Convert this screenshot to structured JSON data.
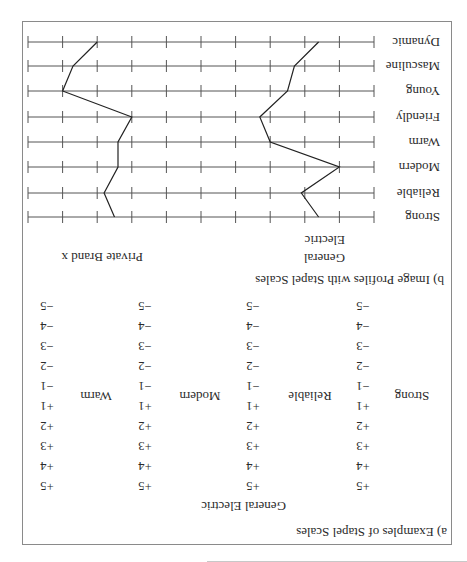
{
  "part_a": {
    "heading": "a)  Examples of Stapel Scales",
    "brand": "General Electric",
    "scale_values": [
      "+5",
      "+4",
      "+3",
      "+2",
      "+1",
      "−1",
      "−2",
      "−3",
      "−4",
      "−5"
    ],
    "items": [
      {
        "label": "Strong"
      },
      {
        "label": "Reliable"
      },
      {
        "label": "Modern"
      },
      {
        "label": "Warm"
      }
    ]
  },
  "part_b": {
    "heading": "b)  Image Profiles with Stapel Scales",
    "legend": [
      {
        "name_line1": "General",
        "name_line2": "Electric"
      },
      {
        "name_line1": "Private Brand x",
        "name_line2": ""
      }
    ]
  },
  "chart_data": {
    "type": "line",
    "title": "Image Profiles with Stapel Scales",
    "orientation": "horizontal profile (attributes as rows, scale on x)",
    "categories": [
      "Strong",
      "Reliable",
      "Modern",
      "Warm",
      "Friendly",
      "Young",
      "Masculine",
      "Dynamic"
    ],
    "xlim": [
      5,
      -5
    ],
    "x_ticks": [
      5,
      4,
      3,
      2,
      1,
      0,
      -1,
      -2,
      -3,
      -4,
      -5
    ],
    "tick_labels_shown": false,
    "grid": true,
    "legend_position": "above plot (text labels)",
    "series": [
      {
        "name": "General Electric",
        "values": [
          3.4,
          2.9,
          4.0,
          2.0,
          1.7,
          2.5,
          2.7,
          3.4
        ]
      },
      {
        "name": "Private Brand x",
        "values": [
          -2.5,
          -2.8,
          -2.4,
          -2.4,
          -2.0,
          -4.0,
          -3.7,
          -3.0
        ]
      }
    ],
    "note": "Image is displayed rotated 180 degrees"
  }
}
